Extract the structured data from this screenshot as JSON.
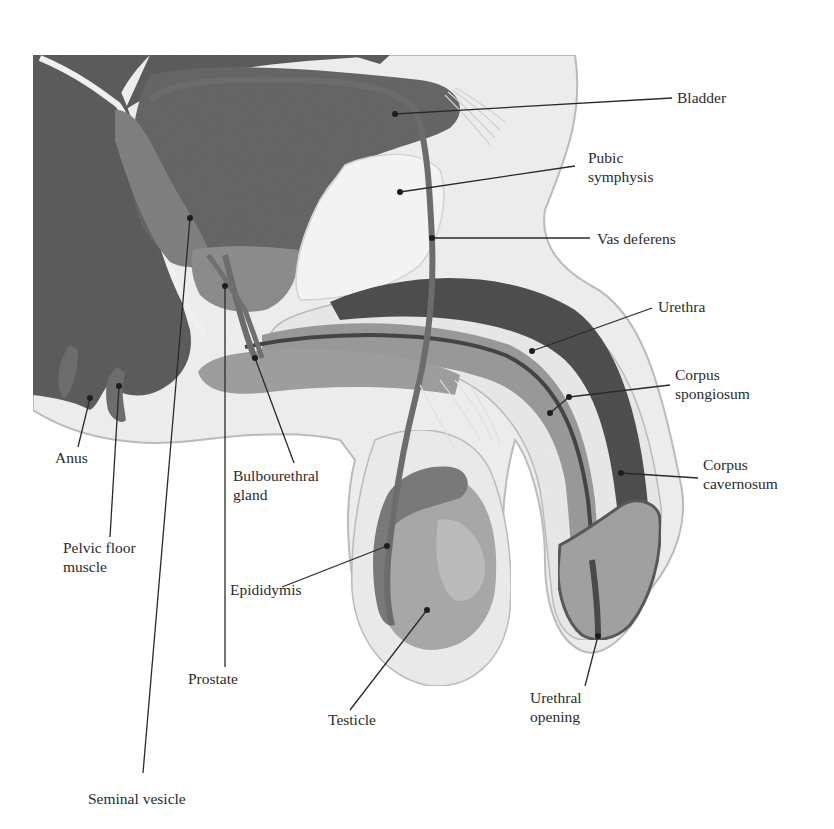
{
  "figure": {
    "colors": {
      "background": "#ffffff",
      "dark_tissue": "#5a5a5a",
      "bladder": "#656565",
      "prostate": "#8a8a8a",
      "light_tissue": "#ececec",
      "skin_outline": "#b5b5b5",
      "spongy": "#9a9a9a",
      "cavernosum": "#4e4e4e",
      "testicle": "#a8a8a8",
      "epididymis": "#7a7a7a",
      "leader_line": "#2a2a2a"
    }
  },
  "labels": [
    {
      "id": "bladder",
      "lines": [
        "Bladder"
      ],
      "x": 677,
      "y": 88,
      "dot": [
        395,
        114
      ],
      "end": [
        672,
        98
      ]
    },
    {
      "id": "pubic-symphysis",
      "lines": [
        "Pubic",
        "symphysis"
      ],
      "x": 588,
      "y": 148,
      "dot": [
        400,
        192
      ],
      "end": [
        575,
        166
      ]
    },
    {
      "id": "vas-deferens",
      "lines": [
        "Vas deferens"
      ],
      "x": 597,
      "y": 229,
      "dot": [
        432,
        238
      ],
      "end": [
        590,
        238
      ]
    },
    {
      "id": "urethra",
      "lines": [
        "Urethra"
      ],
      "x": 658,
      "y": 297,
      "dot": [
        532,
        351
      ],
      "end": [
        652,
        308
      ]
    },
    {
      "id": "corpus-spongiosum",
      "lines": [
        "Corpus",
        "spongiosum"
      ],
      "x": 675,
      "y": 365,
      "dot": [
        569,
        397
      ],
      "end": [
        670,
        385
      ]
    },
    {
      "id": "corpus-spongiosum-2",
      "lines": [],
      "x": 0,
      "y": 0,
      "dot": [
        550,
        413
      ],
      "end": [
        569,
        397
      ]
    },
    {
      "id": "corpus-cavernosum",
      "lines": [
        "Corpus",
        "cavernosum"
      ],
      "x": 703,
      "y": 455,
      "dot": [
        621,
        473
      ],
      "end": [
        698,
        478
      ]
    },
    {
      "id": "anus",
      "lines": [
        "Anus"
      ],
      "x": 55,
      "y": 448,
      "dot": [
        90,
        398
      ],
      "end": [
        78,
        447
      ]
    },
    {
      "id": "pelvic-floor-muscle",
      "lines": [
        "Pelvic floor",
        "muscle"
      ],
      "x": 63,
      "y": 538,
      "dot": [
        119,
        386
      ],
      "end": [
        110,
        537
      ]
    },
    {
      "id": "seminal-vesicle",
      "lines": [
        "Seminal vesicle"
      ],
      "x": 88,
      "y": 789,
      "dot": [
        190,
        218
      ],
      "end": [
        143,
        773
      ]
    },
    {
      "id": "prostate",
      "lines": [
        "Prostate"
      ],
      "x": 188,
      "y": 669,
      "dot": [
        225,
        286
      ],
      "end": [
        225,
        667
      ]
    },
    {
      "id": "bulbourethral-gland",
      "lines": [
        "Bulbourethral",
        "gland"
      ],
      "x": 233,
      "y": 466,
      "dot": [
        255,
        358
      ],
      "end": [
        294,
        463
      ]
    },
    {
      "id": "epididymis",
      "lines": [
        "Epididymis"
      ],
      "x": 230,
      "y": 580,
      "dot": [
        387,
        546
      ],
      "end": [
        282,
        587
      ]
    },
    {
      "id": "testicle",
      "lines": [
        "Testicle"
      ],
      "x": 328,
      "y": 710,
      "dot": [
        427,
        610
      ],
      "end": [
        350,
        710
      ]
    },
    {
      "id": "urethral-opening",
      "lines": [
        "Urethral",
        "opening"
      ],
      "x": 530,
      "y": 688,
      "dot": [
        598,
        636
      ],
      "end": [
        585,
        686
      ]
    }
  ]
}
